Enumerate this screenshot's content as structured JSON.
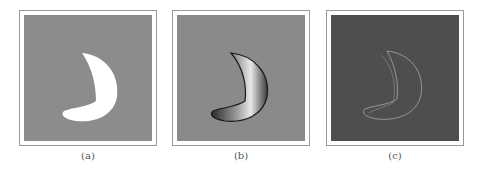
{
  "figure": {
    "panels": [
      {
        "id": "a",
        "label": "(a)",
        "description": "binary crescent silhouette",
        "background": "#8c8c8c",
        "shape_fill": "#ffffff"
      },
      {
        "id": "b",
        "label": "(b)",
        "description": "shaded 3D crescent surface",
        "background": "#8a8a8a",
        "shape_fill": "#b0b0b0"
      },
      {
        "id": "c",
        "label": "(c)",
        "description": "edge / gradient map of crescent",
        "background": "#4e4e4e",
        "shape_fill": "#9a9a9a"
      }
    ]
  }
}
